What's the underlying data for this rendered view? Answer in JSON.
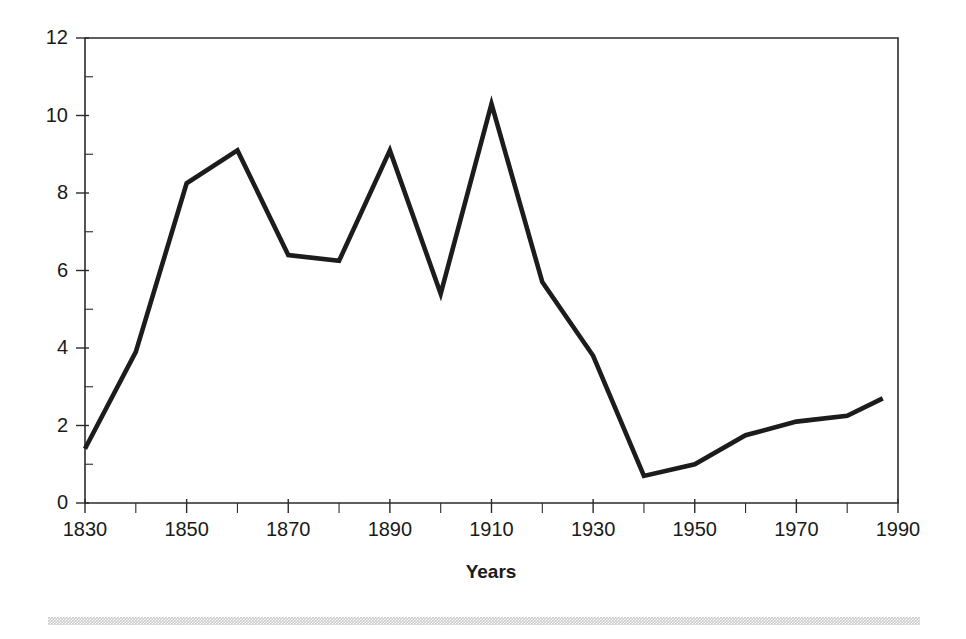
{
  "figure": {
    "background_color": "#ffffff",
    "line_color": "#1c1c1c",
    "axis_color": "#2b2b2b",
    "footer_rule_color": "#c9c9c9"
  },
  "chart_data": {
    "type": "line",
    "title": "",
    "subtitle": "",
    "xlabel": "Years",
    "ylabel": "",
    "xlim": [
      1830,
      1990
    ],
    "ylim": [
      0,
      12
    ],
    "grid": false,
    "legend": false,
    "legend_position": "none",
    "x_tick_labels": [
      "1830",
      "1850",
      "1870",
      "1890",
      "1910",
      "1930",
      "1950",
      "1970",
      "1990"
    ],
    "x_major_ticks": [
      1830,
      1850,
      1870,
      1890,
      1910,
      1930,
      1950,
      1970,
      1990
    ],
    "x_minor_ticks": [
      1840,
      1860,
      1880,
      1900,
      1920,
      1940,
      1950,
      1960,
      1980
    ],
    "y_tick_labels": [
      "0",
      "2",
      "4",
      "6",
      "8",
      "10",
      "12"
    ],
    "y_major_ticks": [
      0,
      2,
      4,
      6,
      8,
      10,
      12
    ],
    "y_minor_ticks": [
      1,
      3,
      5,
      7,
      9,
      11
    ],
    "x": [
      1830,
      1840,
      1850,
      1860,
      1870,
      1880,
      1890,
      1900,
      1910,
      1920,
      1930,
      1940,
      1950,
      1960,
      1970,
      1980,
      1987
    ],
    "values": [
      1.4,
      3.9,
      8.25,
      9.1,
      6.4,
      6.25,
      9.1,
      5.4,
      10.3,
      5.7,
      3.8,
      0.7,
      1.0,
      1.75,
      2.1,
      2.25,
      2.7
    ],
    "series": [
      {
        "name": "series-1",
        "values": [
          1.4,
          3.9,
          8.25,
          9.1,
          6.4,
          6.25,
          9.1,
          5.4,
          10.3,
          5.7,
          3.8,
          0.7,
          1.0,
          1.75,
          2.1,
          2.25,
          2.7
        ]
      }
    ],
    "annotations": []
  }
}
